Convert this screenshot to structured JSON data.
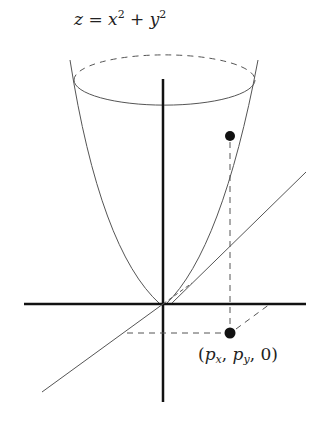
{
  "diagram": {
    "equation": {
      "lhs": "z",
      "eq": "=",
      "x": "x",
      "y": "y",
      "exp": "2",
      "plus": "+"
    },
    "point_label": {
      "open": "(",
      "p": "p",
      "sx": "x",
      "sy": "y",
      "comma": ",",
      "zero": "0",
      "close": ")"
    },
    "colors": {
      "axes": "#111111",
      "curve": "#555555",
      "dashed": "#555555",
      "dot": "#111111"
    },
    "elements": [
      "paraboloid",
      "x-axis",
      "y-axis",
      "z-axis",
      "point-above",
      "projected-point",
      "projection-lines"
    ]
  }
}
